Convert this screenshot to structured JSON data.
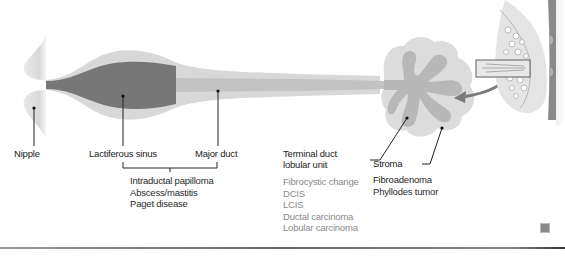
{
  "diagram": {
    "colors": {
      "duct_light": "#d6d6d6",
      "duct_mid": "#c4c4c4",
      "sinus_dark": "#757575",
      "lobule_outer": "#dcdcdc",
      "lobule_inner": "#b6b6b6",
      "label_text": "#222222",
      "grey_text": "#8a8a8a",
      "arrow": "#7a7a7a"
    },
    "labels": {
      "nipple": "Nipple",
      "lactiferous_sinus": "Lactiferous sinus",
      "major_duct": "Major duct",
      "tdlu_line1": "Terminal duct",
      "tdlu_line2": "lobular unit",
      "stroma": "Stroma"
    },
    "duct_pathologies": [
      "Intraductal papilloma",
      "Abscess/mastitis",
      "Paget disease"
    ],
    "tdlu_pathologies": [
      "Fibrocystic change",
      "DCIS",
      "LCIS",
      "Ductal carcinoma",
      "Lobular carcinoma"
    ],
    "stroma_pathologies": [
      "Fibroadenoma",
      "Phyllodes tumor"
    ],
    "inset": {
      "description": "breast cross-section with highlighted duct region",
      "arrow": "arrow pointing from inset to enlarged lobule"
    }
  }
}
